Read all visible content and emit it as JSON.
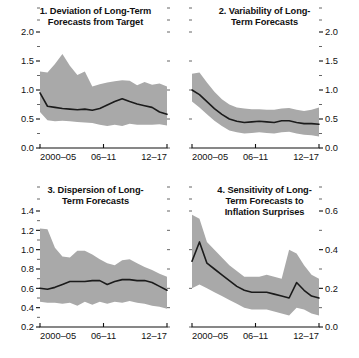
{
  "figure": {
    "background": "#ffffff",
    "band_color": "#a9a9a9",
    "line_color": "#1b1b1b",
    "x_tick_labels": [
      "2000–05",
      "06–11",
      "12–17"
    ]
  },
  "panels": [
    {
      "id": "panel-1",
      "title": "1. Deviation of Long-Term\nForecasts from Target",
      "axis_side": "left",
      "y_ticks": [
        "2.0",
        "1.5",
        "1.0",
        "0.5",
        "0.0"
      ],
      "x_tick_labels": [
        "2000–05",
        "06–11",
        "12–17"
      ]
    },
    {
      "id": "panel-2",
      "title": "2. Variability of Long-\nTerm Forecasts",
      "axis_side": "right",
      "y_ticks": [
        "2.0",
        "1.5",
        "1.0",
        "0.5",
        "0.0"
      ],
      "x_tick_labels": [
        "2000–05",
        "06–11",
        "12–17"
      ]
    },
    {
      "id": "panel-3",
      "title": "3. Dispersion of Long-\nTerm Forecasts",
      "axis_side": "left",
      "y_ticks": [
        "1.4",
        "1.2",
        "1.0",
        "0.8",
        "0.6",
        "0.4",
        "0.2"
      ],
      "x_tick_labels": [
        "2000–05",
        "06–11",
        "12–17"
      ]
    },
    {
      "id": "panel-4",
      "title": "4. Sensitivity of Long-\nTerm Forecasts to\nInflation Surprises",
      "axis_side": "right",
      "y_ticks": [
        "0.6",
        "0.4",
        "0.2",
        "0.0"
      ],
      "x_tick_labels": [
        "2000–05",
        "06–11",
        "12–17"
      ]
    }
  ],
  "chart_data": [
    {
      "type": "area",
      "id": "panel-1",
      "title": "1. Deviation of Long-Term Forecasts from Target",
      "xlabel": "",
      "ylabel": "",
      "ylim": [
        0.0,
        2.0
      ],
      "ytick_values": [
        0.0,
        0.5,
        1.0,
        1.5,
        2.0
      ],
      "yminor_step": 0.25,
      "grid": false,
      "legend": "none",
      "axis_side": "left",
      "x": [
        0,
        1,
        2,
        3,
        4,
        5,
        6,
        7,
        8,
        9,
        10,
        11,
        12,
        13,
        14,
        15,
        16,
        17
      ],
      "x_tick_positions": [
        0,
        8.5,
        17
      ],
      "x_tick_labels": [
        "2000–05",
        "06–11",
        "12–17"
      ],
      "series": [
        {
          "name": "median",
          "values": [
            0.95,
            0.72,
            0.7,
            0.68,
            0.67,
            0.66,
            0.67,
            0.65,
            0.68,
            0.74,
            0.8,
            0.85,
            0.8,
            0.76,
            0.73,
            0.7,
            0.62,
            0.58
          ]
        },
        {
          "name": "upper",
          "values": [
            1.32,
            1.3,
            1.45,
            1.62,
            1.42,
            1.26,
            1.32,
            1.06,
            1.1,
            1.13,
            1.15,
            1.17,
            1.16,
            1.08,
            1.14,
            1.09,
            1.11,
            1.06
          ]
        },
        {
          "name": "lower",
          "values": [
            0.62,
            0.48,
            0.46,
            0.47,
            0.46,
            0.45,
            0.44,
            0.43,
            0.4,
            0.38,
            0.4,
            0.38,
            0.42,
            0.4,
            0.4,
            0.4,
            0.41,
            0.39
          ]
        }
      ]
    },
    {
      "type": "area",
      "id": "panel-2",
      "title": "2. Variability of Long-Term Forecasts",
      "xlabel": "",
      "ylabel": "",
      "ylim": [
        0.0,
        2.0
      ],
      "ytick_values": [
        0.0,
        0.5,
        1.0,
        1.5,
        2.0
      ],
      "yminor_step": 0.25,
      "grid": false,
      "legend": "none",
      "axis_side": "right",
      "x": [
        0,
        1,
        2,
        3,
        4,
        5,
        6,
        7,
        8,
        9,
        10,
        11,
        12,
        13,
        14,
        15,
        16,
        17
      ],
      "x_tick_positions": [
        0,
        8.5,
        17
      ],
      "x_tick_labels": [
        "2000–05",
        "06–11",
        "12–17"
      ],
      "series": [
        {
          "name": "median",
          "values": [
            1.0,
            0.92,
            0.8,
            0.68,
            0.58,
            0.5,
            0.46,
            0.44,
            0.45,
            0.46,
            0.45,
            0.44,
            0.47,
            0.47,
            0.44,
            0.42,
            0.42,
            0.41
          ]
        },
        {
          "name": "upper",
          "values": [
            1.28,
            1.3,
            1.13,
            0.97,
            0.84,
            0.75,
            0.7,
            0.68,
            0.67,
            0.67,
            0.66,
            0.66,
            0.68,
            0.69,
            0.66,
            0.64,
            0.66,
            0.7
          ]
        },
        {
          "name": "lower",
          "values": [
            0.8,
            0.7,
            0.58,
            0.47,
            0.38,
            0.3,
            0.27,
            0.25,
            0.26,
            0.27,
            0.26,
            0.25,
            0.27,
            0.28,
            0.25,
            0.23,
            0.22,
            0.2
          ]
        }
      ]
    },
    {
      "type": "area",
      "id": "panel-3",
      "title": "3. Dispersion of Long-Term Forecasts",
      "xlabel": "",
      "ylabel": "",
      "ylim": [
        0.2,
        1.4
      ],
      "ytick_values": [
        0.2,
        0.4,
        0.6,
        0.8,
        1.0,
        1.2,
        1.4
      ],
      "yminor_step": 0.1,
      "grid": false,
      "legend": "none",
      "axis_side": "left",
      "x": [
        0,
        1,
        2,
        3,
        4,
        5,
        6,
        7,
        8,
        9,
        10,
        11,
        12,
        13,
        14,
        15,
        16,
        17
      ],
      "x_tick_positions": [
        0,
        8.5,
        17
      ],
      "x_tick_labels": [
        "2000–05",
        "06–11",
        "12–17"
      ],
      "series": [
        {
          "name": "median",
          "values": [
            0.6,
            0.59,
            0.61,
            0.64,
            0.67,
            0.67,
            0.67,
            0.68,
            0.68,
            0.64,
            0.67,
            0.69,
            0.69,
            0.68,
            0.68,
            0.66,
            0.62,
            0.58
          ]
        },
        {
          "name": "upper",
          "values": [
            1.22,
            1.21,
            1.02,
            0.93,
            0.92,
            0.99,
            0.99,
            0.95,
            0.9,
            0.86,
            0.84,
            0.89,
            0.9,
            0.86,
            0.82,
            0.79,
            0.75,
            0.72
          ]
        },
        {
          "name": "lower",
          "values": [
            0.46,
            0.45,
            0.45,
            0.44,
            0.45,
            0.42,
            0.46,
            0.43,
            0.46,
            0.44,
            0.46,
            0.45,
            0.47,
            0.45,
            0.44,
            0.42,
            0.41,
            0.39
          ]
        }
      ]
    },
    {
      "type": "area",
      "id": "panel-4",
      "title": "4. Sensitivity of Long-Term Forecasts to Inflation Surprises",
      "xlabel": "",
      "ylabel": "",
      "ylim": [
        0.0,
        0.6
      ],
      "ytick_values": [
        0.0,
        0.2,
        0.4,
        0.6
      ],
      "yminor_step": 0.1,
      "grid": false,
      "legend": "none",
      "axis_side": "right",
      "x": [
        0,
        1,
        2,
        3,
        4,
        5,
        6,
        7,
        8,
        9,
        10,
        11,
        12,
        13,
        14,
        15,
        16,
        17
      ],
      "x_tick_positions": [
        0,
        8.5,
        17
      ],
      "x_tick_labels": [
        "2000–05",
        "06–11",
        "12–17"
      ],
      "series": [
        {
          "name": "median",
          "values": [
            0.34,
            0.44,
            0.33,
            0.3,
            0.27,
            0.24,
            0.21,
            0.19,
            0.18,
            0.18,
            0.18,
            0.17,
            0.16,
            0.15,
            0.23,
            0.19,
            0.16,
            0.15
          ]
        },
        {
          "name": "upper",
          "values": [
            0.58,
            0.56,
            0.44,
            0.4,
            0.36,
            0.32,
            0.29,
            0.26,
            0.26,
            0.26,
            0.27,
            0.26,
            0.25,
            0.4,
            0.38,
            0.32,
            0.27,
            0.25
          ]
        },
        {
          "name": "lower",
          "values": [
            0.2,
            0.22,
            0.2,
            0.18,
            0.16,
            0.14,
            0.12,
            0.1,
            0.09,
            0.09,
            0.09,
            0.08,
            0.07,
            0.06,
            0.1,
            0.09,
            0.07,
            0.06
          ]
        }
      ]
    }
  ]
}
